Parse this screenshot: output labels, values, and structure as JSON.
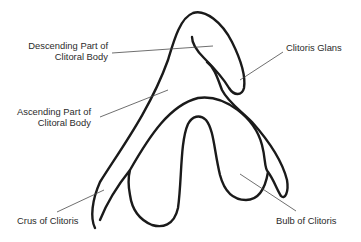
{
  "diagram": {
    "colors": {
      "outline": "#1a1a1a",
      "leader": "#4a4a4a",
      "text": "#2b2b2b",
      "background": "#ffffff"
    }
  },
  "labels": {
    "descending": {
      "line1": "Descending Part of",
      "line2": "Clitoral Body"
    },
    "glans": {
      "line1": "Clitoris Glans"
    },
    "ascending": {
      "line1": "Ascending Part of",
      "line2": "Clitoral Body"
    },
    "crus": {
      "line1": "Crus of Clitoris"
    },
    "bulb": {
      "line1": "Bulb of Clitoris"
    }
  }
}
